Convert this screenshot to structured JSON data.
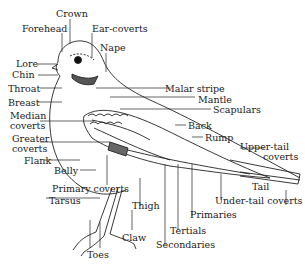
{
  "diagram": {
    "labels": {
      "crown": "Crown",
      "forehead": "Forehead",
      "ear_coverts": "Ear-coverts",
      "nape": "Nape",
      "lore": "Lore",
      "chin": "Chin",
      "throat": "Throat",
      "malar_stripe": "Malar stripe",
      "mantle": "Mantle",
      "breast": "Breast",
      "scapulars": "Scapulars",
      "median_coverts_1": "Median",
      "median_coverts_2": "coverts",
      "back": "Back",
      "rump": "Rump",
      "greater_coverts_1": "Greater",
      "greater_coverts_2": "coverts",
      "upper_tail_coverts_1": "Upper-tail",
      "upper_tail_coverts_2": "coverts",
      "flank": "Flank",
      "belly": "Belly",
      "primary_coverts": "Primary coverts",
      "tail": "Tail",
      "under_tail_coverts": "Under-tail coverts",
      "tarsus": "Tarsus",
      "thigh": "Thigh",
      "primaries": "Primaries",
      "tertials": "Tertials",
      "claw": "Claw",
      "secondaries": "Secondaries",
      "toes": "Toes"
    }
  }
}
